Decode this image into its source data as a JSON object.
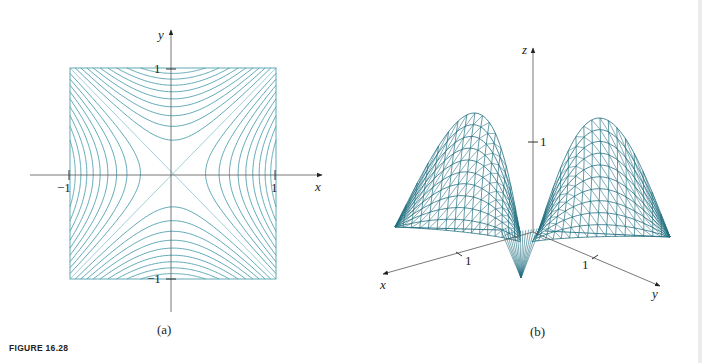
{
  "figure": {
    "caption": "FIGURE 16.28",
    "colors": {
      "contour": "#4e9fae",
      "contour_diag": "#8cc3cc",
      "mesh": "#216f80",
      "axis": "#555555",
      "text": "#222222"
    },
    "panel_a": {
      "label": "(a)",
      "type": "contour plot",
      "x_axis_label": "x",
      "y_axis_label": "y",
      "x_ticks": [
        "−1",
        "1"
      ],
      "y_ticks": [
        "1",
        "−1"
      ],
      "domain": {
        "x": [
          -1,
          1
        ],
        "y": [
          -1,
          1
        ]
      },
      "function": "z = x^2 - y^2",
      "levels": [
        -0.9,
        -0.8,
        -0.7,
        -0.6,
        -0.5,
        -0.4,
        -0.3,
        -0.2,
        -0.1,
        0,
        0.1,
        0.2,
        0.3,
        0.4,
        0.5,
        0.6,
        0.7,
        0.8,
        0.9
      ]
    },
    "panel_b": {
      "label": "(b)",
      "type": "3d wireframe surface",
      "x_axis_label": "x",
      "y_axis_label": "y",
      "z_axis_label": "z",
      "x_tick": "1",
      "y_tick": "1",
      "z_tick": "1"
    }
  }
}
